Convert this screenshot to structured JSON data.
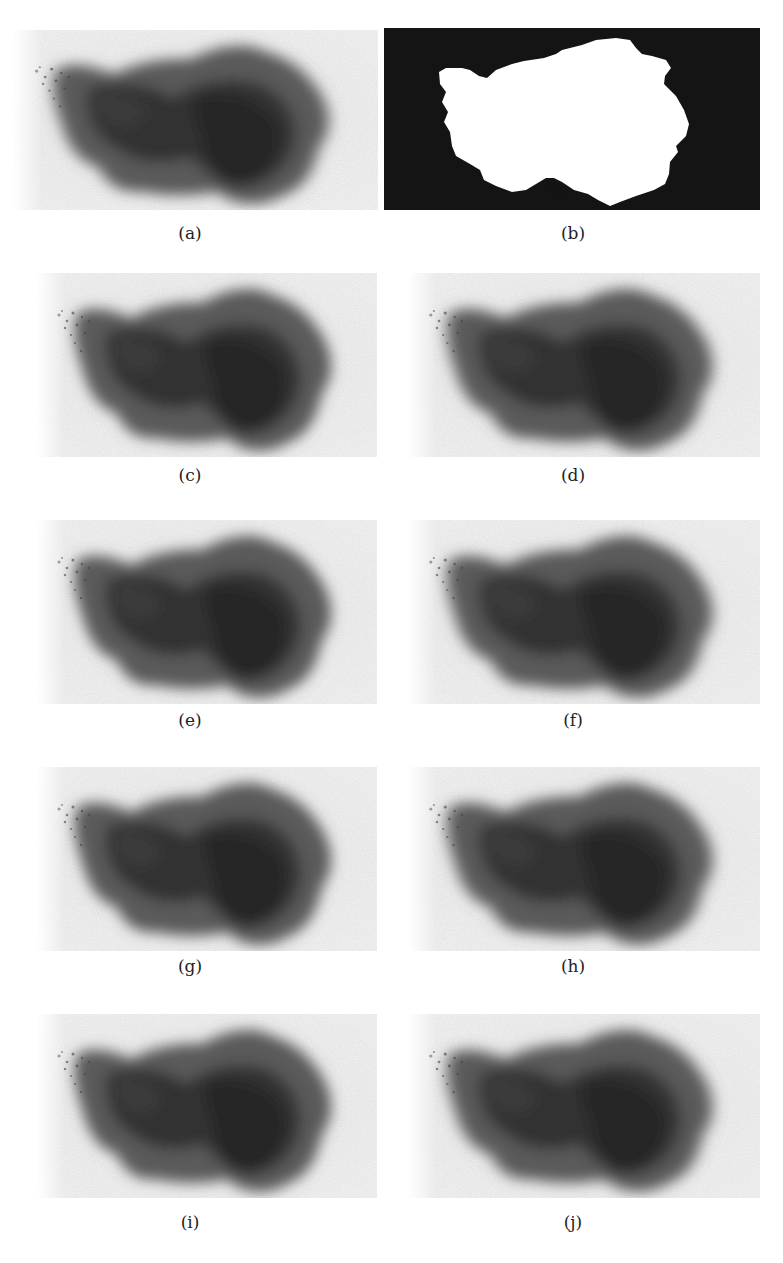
{
  "figure": {
    "panels": [
      {
        "id": "a",
        "label": "(a)",
        "kind": "lesion-image",
        "variant": "original"
      },
      {
        "id": "b",
        "label": "(b)",
        "kind": "segmentation-mask",
        "variant": "binary-mask"
      },
      {
        "id": "c",
        "label": "(c)",
        "kind": "lesion-image",
        "variant": "processed"
      },
      {
        "id": "d",
        "label": "(d)",
        "kind": "lesion-image",
        "variant": "processed"
      },
      {
        "id": "e",
        "label": "(e)",
        "kind": "lesion-image",
        "variant": "processed"
      },
      {
        "id": "f",
        "label": "(f)",
        "kind": "lesion-image",
        "variant": "processed"
      },
      {
        "id": "g",
        "label": "(g)",
        "kind": "lesion-image",
        "variant": "processed"
      },
      {
        "id": "h",
        "label": "(h)",
        "kind": "lesion-image",
        "variant": "processed"
      },
      {
        "id": "i",
        "label": "(i)",
        "kind": "lesion-image",
        "variant": "processed"
      },
      {
        "id": "j",
        "label": "(j)",
        "kind": "lesion-image",
        "variant": "processed"
      }
    ],
    "layout": {
      "rows": 5,
      "columns": 2
    },
    "colors": {
      "background": "#ffffff",
      "skin": "#f0f0f0",
      "lesion_dark": "#2b2b2b",
      "lesion_mid": "#555555",
      "mask_bg": "#141414",
      "mask_fg": "#ffffff"
    }
  }
}
